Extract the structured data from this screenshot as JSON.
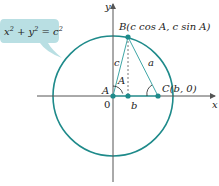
{
  "colors": {
    "circle": "#1e8a8a",
    "triangle": "#3fa6a6",
    "point": "#1e8a8a",
    "axis": "#555555",
    "callout_bg": "#b9dfe3",
    "text": "#222222"
  },
  "callout": {
    "equation_x": "x",
    "equation_plus": " + ",
    "equation_y": "y",
    "equation_eq": " = ",
    "equation_c": "c",
    "exp": "2"
  },
  "axes": {
    "x_label": "x",
    "y_label": "y",
    "origin_label": "0"
  },
  "points": {
    "A": {
      "label": "A"
    },
    "B": {
      "label": "B(c cos A, c sin A)"
    },
    "C": {
      "label": "C(b, 0)"
    }
  },
  "sides": {
    "a": "a",
    "b": "b",
    "c": "c"
  },
  "angle_label": "A"
}
